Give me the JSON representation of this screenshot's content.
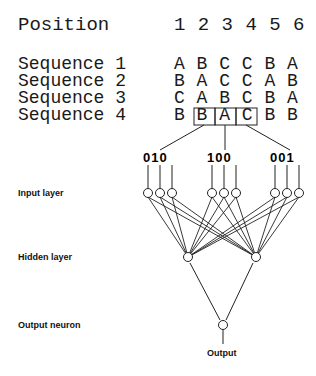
{
  "header": {
    "label": "Position",
    "positions": "1 2 3 4 5 6"
  },
  "sequences": [
    {
      "label": "Sequence 1",
      "letters": "A B C C B A"
    },
    {
      "label": "Sequence 2",
      "letters": "B A C C A B"
    },
    {
      "label": "Sequence 3",
      "letters": "C A B C B A"
    },
    {
      "label": "Sequence 4",
      "letters": "B B A C B B"
    }
  ],
  "window": {
    "sequence": 4,
    "positions": [
      2,
      3,
      4
    ],
    "letters": [
      "B",
      "A",
      "C"
    ]
  },
  "encodings": [
    {
      "letter": "B",
      "bits": "010"
    },
    {
      "letter": "A",
      "bits": "100"
    },
    {
      "letter": "C",
      "bits": "001"
    }
  ],
  "layers": {
    "input": "Input layer",
    "hidden": "Hidden layer",
    "output": "Output neuron",
    "output_label": "Output"
  },
  "network": {
    "input_nodes": 9,
    "hidden_nodes": 2,
    "output_nodes": 1
  }
}
